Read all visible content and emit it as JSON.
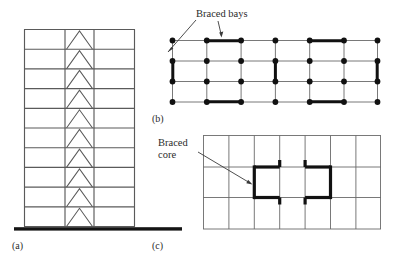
{
  "figure": {
    "background_color": "#ffffff",
    "line_color": "#555555",
    "bold_color": "#111111",
    "text_color": "#2b2b2b"
  },
  "annotations": {
    "braced_bays": "Braced bays",
    "braced_core_line1": "Braced",
    "braced_core_line2": "core"
  },
  "captions": {
    "a": "(a)",
    "b": "(b)",
    "c": "(c)"
  },
  "panel_a": {
    "name": "braced-frame-elevation",
    "stories": 10,
    "bays": 3,
    "bracing_type": "chevron",
    "has_ground_line": true
  },
  "panel_b": {
    "name": "braced-bays-plan",
    "columns": 7,
    "rows": 4,
    "braced_bay_count": 6,
    "node_marker": "filled-circle"
  },
  "panel_c": {
    "name": "braced-core-plan",
    "columns": 7,
    "rows": 3,
    "core_openings": 2
  }
}
